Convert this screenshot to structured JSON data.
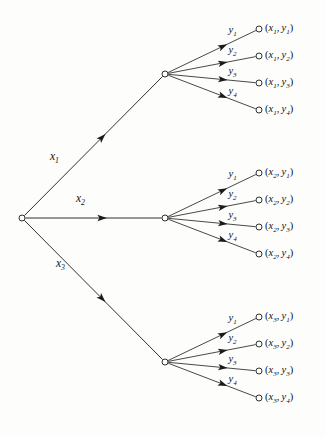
{
  "figure": {
    "type": "probability-tree-diagram",
    "background_color": "#fdfdfc",
    "ink_color": "#1a1a1a"
  },
  "root": {
    "name": "root-node",
    "x": 22,
    "y": 218
  },
  "stage1": {
    "branches": [
      {
        "id": "x1",
        "label_main": "x",
        "label_sub": "1",
        "label_x": 50,
        "label_y": 157,
        "node_x": 165,
        "node_y": 74
      },
      {
        "id": "x2",
        "label_main": "x",
        "label_sub": "2",
        "label_x": 76,
        "label_y": 199,
        "node_x": 165,
        "node_y": 218
      },
      {
        "id": "x3",
        "label_main": "x",
        "label_sub": "3",
        "label_x": 56,
        "label_y": 264,
        "node_x": 165,
        "node_y": 362
      }
    ]
  },
  "stage2": {
    "branch_labels": [
      {
        "main": "y",
        "sub": "1"
      },
      {
        "main": "y",
        "sub": "2"
      },
      {
        "main": "y",
        "sub": "3"
      },
      {
        "main": "y",
        "sub": "4"
      }
    ],
    "groups": [
      {
        "parent": "x1",
        "leaves": [
          {
            "text": "(x1, y1)",
            "var1": "x",
            "sub1": "1",
            "var2": "y",
            "sub2": "1",
            "leaf_x": 259,
            "leaf_y": 29
          },
          {
            "text": "(x1, y2)",
            "var1": "x",
            "sub1": "1",
            "var2": "y",
            "sub2": "2",
            "leaf_x": 259,
            "leaf_y": 56
          },
          {
            "text": "(x1, y3)",
            "var1": "x",
            "sub1": "1",
            "var2": "y",
            "sub2": "3",
            "leaf_x": 259,
            "leaf_y": 83
          },
          {
            "text": "(x1, y4)",
            "var1": "x",
            "sub1": "1",
            "var2": "y",
            "sub2": "4",
            "leaf_x": 259,
            "leaf_y": 110
          }
        ]
      },
      {
        "parent": "x2",
        "leaves": [
          {
            "text": "(x2, y1)",
            "var1": "x",
            "sub1": "2",
            "var2": "y",
            "sub2": "1",
            "leaf_x": 259,
            "leaf_y": 173
          },
          {
            "text": "(x2, y2)",
            "var1": "x",
            "sub1": "2",
            "var2": "y",
            "sub2": "2",
            "leaf_x": 259,
            "leaf_y": 200
          },
          {
            "text": "(x2, y3)",
            "var1": "x",
            "sub1": "2",
            "var2": "y",
            "sub2": "3",
            "leaf_x": 259,
            "leaf_y": 227
          },
          {
            "text": "(x2, y4)",
            "var1": "x",
            "sub1": "2",
            "var2": "y",
            "sub2": "4",
            "leaf_x": 259,
            "leaf_y": 254
          }
        ]
      },
      {
        "parent": "x3",
        "leaves": [
          {
            "text": "(x3, y1)",
            "var1": "x",
            "sub1": "3",
            "var2": "y",
            "sub2": "1",
            "leaf_x": 259,
            "leaf_y": 317
          },
          {
            "text": "(x3, y2)",
            "var1": "x",
            "sub1": "3",
            "var2": "y",
            "sub2": "2",
            "leaf_x": 259,
            "leaf_y": 344
          },
          {
            "text": "(x3, y3)",
            "var1": "x",
            "sub1": "3",
            "var2": "y",
            "sub2": "3",
            "leaf_x": 259,
            "leaf_y": 371
          },
          {
            "text": "(x3, y4)",
            "var1": "x",
            "sub1": "3",
            "var2": "y",
            "sub2": "4",
            "leaf_x": 259,
            "leaf_y": 398
          }
        ]
      }
    ]
  }
}
